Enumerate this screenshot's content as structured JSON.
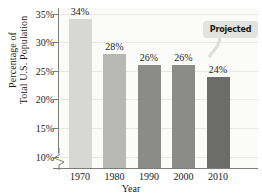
{
  "chart_data": {
    "type": "bar",
    "title": "",
    "subtitle": "",
    "xlabel": "Year",
    "ylabel": "Percentage of Total U.S. Population",
    "ylabel_lines": [
      "Percentage of",
      "Total U.S. Population"
    ],
    "categories": [
      "1970",
      "1980",
      "1990",
      "2000",
      "2010"
    ],
    "values": [
      34,
      28,
      26,
      26,
      24
    ],
    "value_labels": [
      "34%",
      "28%",
      "26%",
      "26%",
      "24%"
    ],
    "ylim": [
      8,
      36
    ],
    "yticks": [
      10,
      15,
      20,
      25,
      30,
      35
    ],
    "ytick_labels": [
      "10%",
      "15%",
      "20%",
      "25%",
      "30%",
      "35%"
    ],
    "grid": true,
    "legend": "none",
    "axis_break": true,
    "bar_colors": [
      "#d7d7d3",
      "#b7b7b3",
      "#8b8b87",
      "#8b8b87",
      "#6c6c68"
    ],
    "annotations": [
      {
        "name": "projected",
        "text": "Projected",
        "points_to": "2010"
      }
    ]
  },
  "annotation": {
    "projected_label": "Projected"
  },
  "axes": {
    "x_title": "Year",
    "y_title_line1": "Percentage of",
    "y_title_line2": "Total U.S. Population"
  },
  "colors": {
    "plot_background": "#fbfbf9",
    "gridline": "#e8e8e4",
    "axis": "#7d7d79",
    "text": "#1b1b1b",
    "callout_background": "#e2e2de"
  }
}
